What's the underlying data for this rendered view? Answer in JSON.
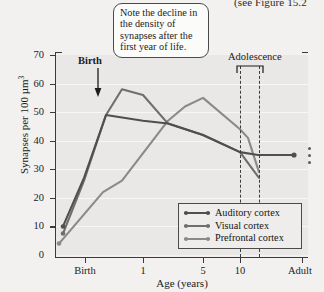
{
  "clipped_reference": "(see Figure 15.2",
  "callout": {
    "text": "Note the decline in the density of synapses after the first year of life."
  },
  "annotations": {
    "birth_label": "Birth",
    "adolescence_label": "Adolescence"
  },
  "legend": {
    "items": [
      {
        "label": "Auditory cortex",
        "color": "#4f4f4f"
      },
      {
        "label": "Visual cortex",
        "color": "#6e6e6e"
      },
      {
        "label": "Prefrontal cortex",
        "color": "#8a8a8a"
      }
    ]
  },
  "chart_data": {
    "type": "line",
    "title": "",
    "xlabel": "Age (years)",
    "ylabel": "Synapses per 100 µm³",
    "ylim": [
      0,
      70
    ],
    "yticks": [
      0,
      10,
      20,
      30,
      40,
      50,
      60,
      70
    ],
    "ytick_labels": [
      "0",
      "10",
      "20",
      "30",
      "40",
      "50",
      "60",
      "70"
    ],
    "xtick_labels": [
      "Birth",
      "1",
      "5",
      "10",
      "Adult"
    ],
    "xtick_positions_px": [
      85,
      143,
      203,
      240,
      302
    ],
    "grid": "horizontal",
    "legend_position": "bottom-right",
    "series": [
      {
        "name": "Auditory cortex",
        "color": "#4f4f4f",
        "points": [
          {
            "x_px": 63,
            "value": 10
          },
          {
            "x_px": 84,
            "value": 27
          },
          {
            "x_px": 106,
            "value": 49
          },
          {
            "x_px": 143,
            "value": 47
          },
          {
            "x_px": 168,
            "value": 46
          },
          {
            "x_px": 203,
            "value": 42
          },
          {
            "x_px": 240,
            "value": 36
          },
          {
            "x_px": 258,
            "value": 35
          },
          {
            "x_px": 294,
            "value": 35
          }
        ]
      },
      {
        "name": "Visual cortex",
        "color": "#6e6e6e",
        "points": [
          {
            "x_px": 63,
            "value": 7.5
          },
          {
            "x_px": 84,
            "value": 26
          },
          {
            "x_px": 106,
            "value": 49
          },
          {
            "x_px": 122,
            "value": 58
          },
          {
            "x_px": 143,
            "value": 56
          },
          {
            "x_px": 168,
            "value": 46
          },
          {
            "x_px": 203,
            "value": 42
          },
          {
            "x_px": 240,
            "value": 36
          },
          {
            "x_px": 259,
            "value": 27
          }
        ]
      },
      {
        "name": "Prefrontal cortex",
        "color": "#8a8a8a",
        "points": [
          {
            "x_px": 59,
            "value": 4
          },
          {
            "x_px": 103,
            "value": 22
          },
          {
            "x_px": 122,
            "value": 26
          },
          {
            "x_px": 168,
            "value": 47
          },
          {
            "x_px": 185,
            "value": 52
          },
          {
            "x_px": 203,
            "value": 55
          },
          {
            "x_px": 240,
            "value": 44
          },
          {
            "x_px": 248,
            "value": 41
          },
          {
            "x_px": 259,
            "value": 29
          }
        ]
      }
    ],
    "adolescence_band_px": [
      240,
      259
    ],
    "endpoint_marker": {
      "x_px": 294,
      "value": 35,
      "series": "Auditory cortex"
    },
    "continuation_dots": 3
  }
}
